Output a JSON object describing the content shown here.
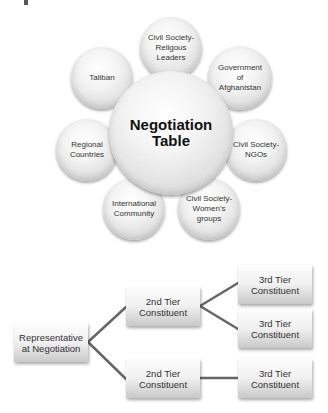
{
  "cluster": {
    "center": {
      "label": "Negotiation\nTable"
    },
    "parties": [
      {
        "id": "religious",
        "label": "Civil Society-\nReligous\nLeaders"
      },
      {
        "id": "government",
        "label": "Government\nof\nAfghanistan"
      },
      {
        "id": "ngos",
        "label": "Civil Society-\nNGOs"
      },
      {
        "id": "womens",
        "label": "Civil Society-\nWomen's\ngroups"
      },
      {
        "id": "international",
        "label": "International\nCommunity"
      },
      {
        "id": "regional",
        "label": "Regional\nCountries"
      },
      {
        "id": "taliban",
        "label": "Taliban"
      }
    ]
  },
  "tree": {
    "root": {
      "label": "Representative\nat Negotiation"
    },
    "tier2": [
      {
        "label": "2nd Tier\nConstituent"
      },
      {
        "label": "2nd Tier\nConstituent"
      }
    ],
    "tier3": [
      {
        "label": "3rd Tier\nConstituent"
      },
      {
        "label": "3rd Tier\nConstituent"
      },
      {
        "label": "3rd Tier\nConstituent"
      }
    ]
  }
}
